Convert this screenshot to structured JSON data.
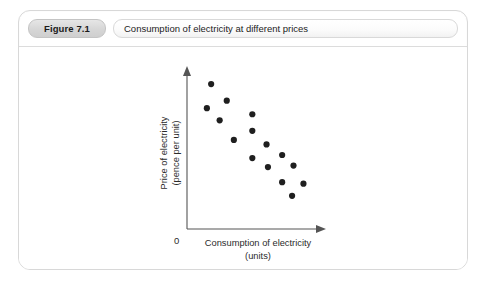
{
  "figure": {
    "number_label": "Figure 7.1",
    "title": "Consumption of electricity at different prices"
  },
  "chart_data": {
    "type": "scatter",
    "title": "Consumption of electricity at different prices",
    "xlabel_line1": "Consumption of electricity",
    "xlabel_line2": "(units)",
    "ylabel_line1": "Price of electricity",
    "ylabel_line2": "(pence per unit)",
    "origin_label": "0",
    "grid": false,
    "legend": "none",
    "xlim": [
      0,
      100
    ],
    "ylim": [
      0,
      100
    ],
    "point_color": "#1f1f1f",
    "axis_color": "#555555",
    "points": [
      {
        "x": 17,
        "y": 96
      },
      {
        "x": 28,
        "y": 85
      },
      {
        "x": 14,
        "y": 80
      },
      {
        "x": 23,
        "y": 72
      },
      {
        "x": 46,
        "y": 76
      },
      {
        "x": 46,
        "y": 65
      },
      {
        "x": 33,
        "y": 59
      },
      {
        "x": 56,
        "y": 56
      },
      {
        "x": 46,
        "y": 47
      },
      {
        "x": 67,
        "y": 49
      },
      {
        "x": 57,
        "y": 41
      },
      {
        "x": 75,
        "y": 42
      },
      {
        "x": 67,
        "y": 31
      },
      {
        "x": 82,
        "y": 30
      },
      {
        "x": 74,
        "y": 22
      }
    ]
  }
}
